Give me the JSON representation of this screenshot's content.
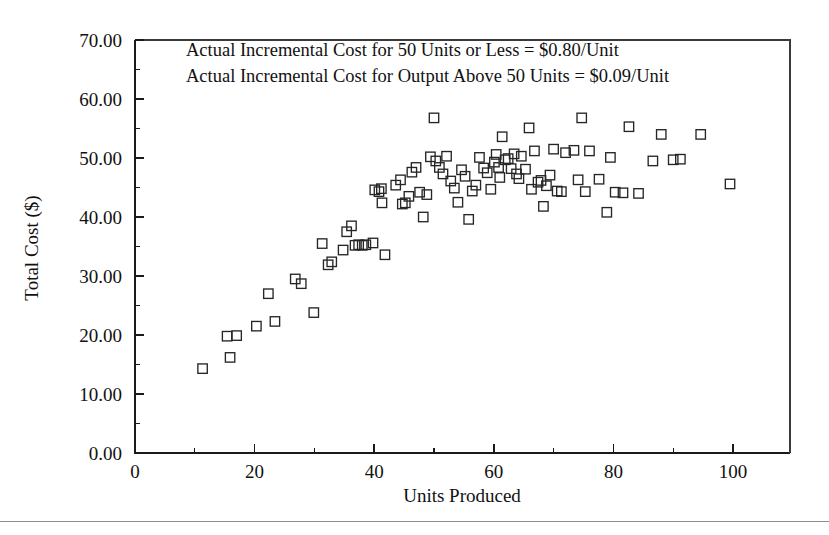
{
  "chart_data": {
    "type": "scatter",
    "title": "",
    "xlabel": "Units Produced",
    "ylabel": "Total Cost ($)",
    "xlim": [
      0,
      110
    ],
    "ylim": [
      0,
      70
    ],
    "grid": false,
    "legend": null,
    "marker": "open-square",
    "xticks": [
      0,
      20,
      40,
      60,
      80,
      100
    ],
    "xticklabels": [
      "0",
      "20",
      "40",
      "60",
      "80",
      "100"
    ],
    "xminorticks": [
      10,
      30,
      50,
      70,
      90,
      110
    ],
    "yticks": [
      0,
      10,
      20,
      30,
      40,
      50,
      60,
      70
    ],
    "yticklabels": [
      "0.00",
      "10.00",
      "20.00",
      "30.00",
      "40.00",
      "50.00",
      "60.00",
      "70.00"
    ],
    "yminorticks": [
      5,
      15,
      25,
      35,
      45,
      55,
      65
    ],
    "annotations": [
      "Actual Incremental Cost for 50 Units or Less = $0.80/Unit",
      "Actual Incremental Cost for Output Above 50 Units = $0.09/Unit"
    ],
    "points": [
      [
        11.3,
        14.3
      ],
      [
        15.4,
        19.8
      ],
      [
        15.9,
        16.2
      ],
      [
        17.0,
        19.9
      ],
      [
        20.3,
        21.5
      ],
      [
        22.3,
        27.0
      ],
      [
        23.4,
        22.3
      ],
      [
        26.8,
        29.5
      ],
      [
        27.8,
        28.7
      ],
      [
        29.9,
        23.8
      ],
      [
        31.3,
        35.5
      ],
      [
        32.3,
        31.9
      ],
      [
        32.9,
        32.4
      ],
      [
        34.8,
        34.4
      ],
      [
        35.4,
        37.5
      ],
      [
        36.2,
        38.5
      ],
      [
        36.8,
        35.2
      ],
      [
        37.4,
        35.3
      ],
      [
        38.0,
        35.2
      ],
      [
        38.6,
        35.3
      ],
      [
        39.8,
        35.6
      ],
      [
        40.1,
        44.6
      ],
      [
        40.8,
        44.3
      ],
      [
        41.2,
        44.8
      ],
      [
        41.3,
        42.4
      ],
      [
        41.8,
        33.6
      ],
      [
        43.6,
        45.4
      ],
      [
        44.4,
        46.3
      ],
      [
        44.7,
        42.2
      ],
      [
        45.2,
        42.4
      ],
      [
        45.8,
        43.5
      ],
      [
        46.3,
        47.6
      ],
      [
        47.0,
        48.4
      ],
      [
        47.6,
        44.2
      ],
      [
        48.2,
        40.0
      ],
      [
        48.8,
        43.8
      ],
      [
        49.4,
        50.2
      ],
      [
        50.0,
        56.8
      ],
      [
        50.3,
        49.5
      ],
      [
        50.9,
        48.4
      ],
      [
        51.5,
        47.3
      ],
      [
        52.1,
        50.3
      ],
      [
        52.8,
        46.1
      ],
      [
        53.4,
        44.9
      ],
      [
        54.0,
        42.5
      ],
      [
        54.6,
        48.0
      ],
      [
        55.2,
        46.9
      ],
      [
        55.8,
        39.6
      ],
      [
        56.4,
        44.4
      ],
      [
        57.0,
        45.4
      ],
      [
        57.6,
        50.1
      ],
      [
        58.3,
        48.3
      ],
      [
        58.9,
        47.5
      ],
      [
        59.5,
        44.7
      ],
      [
        60.1,
        49.3
      ],
      [
        60.4,
        50.6
      ],
      [
        60.8,
        48.4
      ],
      [
        61.0,
        46.7
      ],
      [
        61.4,
        53.6
      ],
      [
        61.9,
        49.7
      ],
      [
        62.4,
        49.9
      ],
      [
        62.9,
        48.2
      ],
      [
        63.4,
        50.7
      ],
      [
        63.8,
        47.3
      ],
      [
        64.2,
        46.5
      ],
      [
        64.6,
        50.3
      ],
      [
        65.3,
        48.1
      ],
      [
        65.9,
        55.1
      ],
      [
        66.3,
        44.7
      ],
      [
        66.8,
        51.2
      ],
      [
        67.4,
        45.9
      ],
      [
        67.9,
        46.2
      ],
      [
        68.3,
        41.8
      ],
      [
        68.8,
        45.3
      ],
      [
        69.4,
        47.1
      ],
      [
        70.0,
        51.5
      ],
      [
        70.6,
        44.4
      ],
      [
        71.3,
        44.3
      ],
      [
        72.0,
        50.9
      ],
      [
        73.4,
        51.3
      ],
      [
        74.1,
        46.3
      ],
      [
        74.7,
        56.8
      ],
      [
        75.3,
        44.3
      ],
      [
        76.0,
        51.2
      ],
      [
        77.6,
        46.4
      ],
      [
        78.9,
        40.8
      ],
      [
        79.5,
        50.1
      ],
      [
        80.3,
        44.2
      ],
      [
        81.6,
        44.1
      ],
      [
        82.6,
        55.3
      ],
      [
        84.2,
        44.0
      ],
      [
        86.6,
        49.5
      ],
      [
        88.0,
        54.0
      ],
      [
        90.0,
        49.7
      ],
      [
        91.2,
        49.8
      ],
      [
        94.6,
        54.0
      ],
      [
        99.5,
        45.6
      ]
    ]
  }
}
